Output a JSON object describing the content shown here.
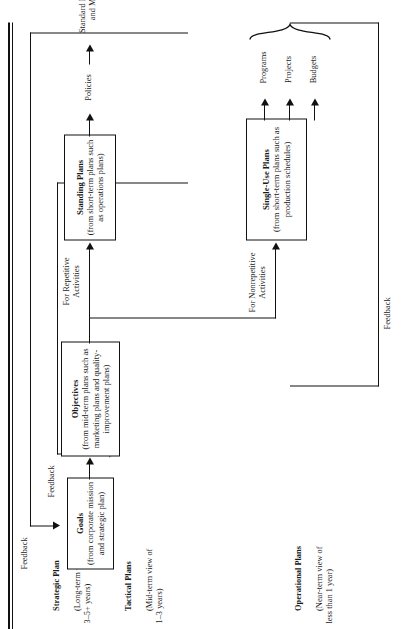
{
  "figure": {
    "caption": "Types of Plans",
    "orientation": "rotated-90-ccw"
  },
  "row_labels": [
    {
      "id": "strategic",
      "title": "Strategic Plan",
      "sub": "(Long-term view of\n3–5+ years)"
    },
    {
      "id": "tactical",
      "title": "Tactical Plans",
      "sub": "(Mid-term view of\n1–3 years)"
    },
    {
      "id": "operational",
      "title": "Operational Plans",
      "sub": "(Near-term view of\nless than 1 year)"
    }
  ],
  "boxes": [
    {
      "id": "goals",
      "title": "Goals",
      "sub": "(from corporate mission\nand strategic plan)"
    },
    {
      "id": "objectives",
      "title": "Objectives",
      "sub": "(from mid-term plans\nsuch as marketing plans and\nquality-improvement plans)"
    },
    {
      "id": "standing",
      "title": "Standing Plans",
      "sub": "(from short-term plans\nsuch as operations plans)"
    },
    {
      "id": "single_use",
      "title": "Single-Use Plans",
      "sub": "(from short-term plans\nsuch as production schedules)"
    }
  ],
  "branch_labels": [
    {
      "id": "repetitive",
      "text": "For Repetitive\nActivities"
    },
    {
      "id": "nonrepetitive",
      "text": "For Nonrepetitive\nActivities"
    }
  ],
  "standing_outputs": [
    {
      "id": "policies",
      "text": "Policies"
    },
    {
      "id": "procedures",
      "text": "Standard Procedures\nand Methods"
    },
    {
      "id": "rules",
      "text": "Rules"
    }
  ],
  "single_use_outputs": [
    {
      "id": "programs",
      "text": "Programs"
    },
    {
      "id": "projects",
      "text": "Projects"
    },
    {
      "id": "budgets",
      "text": "Budgets"
    }
  ],
  "feedback_labels": [
    {
      "id": "feedback-1",
      "text": "Feedback"
    },
    {
      "id": "feedback-2",
      "text": "Feedback"
    },
    {
      "id": "feedback-3",
      "text": "Feedback"
    }
  ],
  "colors": {
    "ink": "#111111",
    "paper": "#ffffff"
  }
}
